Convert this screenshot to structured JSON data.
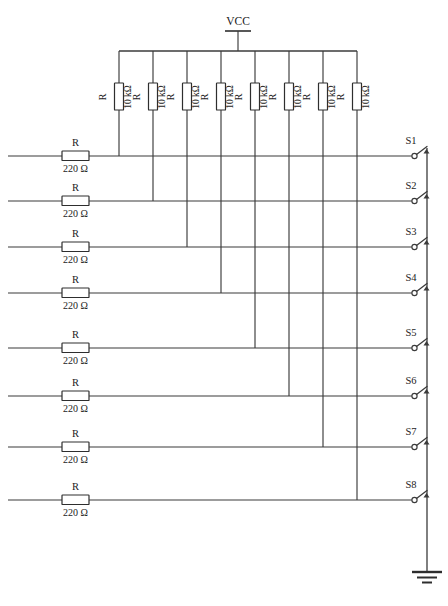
{
  "diagram": {
    "power_label": "VCC",
    "ground_label": "",
    "line_color": "#3b3b3b",
    "background_color": "#ffffff"
  },
  "pullup_resistors": [
    {
      "ref": "R",
      "value": "10 kΩ"
    },
    {
      "ref": "R",
      "value": "10 kΩ"
    },
    {
      "ref": "R",
      "value": "10 kΩ"
    },
    {
      "ref": "R",
      "value": "10 kΩ"
    },
    {
      "ref": "R",
      "value": "10 kΩ"
    },
    {
      "ref": "R",
      "value": "10 kΩ"
    },
    {
      "ref": "R",
      "value": "10 kΩ"
    },
    {
      "ref": "R",
      "value": "10 kΩ"
    }
  ],
  "series_resistors": [
    {
      "ref": "R",
      "value": "220 Ω"
    },
    {
      "ref": "R",
      "value": "220 Ω"
    },
    {
      "ref": "R",
      "value": "220 Ω"
    },
    {
      "ref": "R",
      "value": "220 Ω"
    },
    {
      "ref": "R",
      "value": "220 Ω"
    },
    {
      "ref": "R",
      "value": "220 Ω"
    },
    {
      "ref": "R",
      "value": "220 Ω"
    },
    {
      "ref": "R",
      "value": "220 Ω"
    }
  ],
  "switches": [
    {
      "ref": "S1",
      "state": "open"
    },
    {
      "ref": "S2",
      "state": "open"
    },
    {
      "ref": "S3",
      "state": "open"
    },
    {
      "ref": "S4",
      "state": "open"
    },
    {
      "ref": "S5",
      "state": "open"
    },
    {
      "ref": "S6",
      "state": "open"
    },
    {
      "ref": "S7",
      "state": "open"
    },
    {
      "ref": "S8",
      "state": "open"
    }
  ]
}
